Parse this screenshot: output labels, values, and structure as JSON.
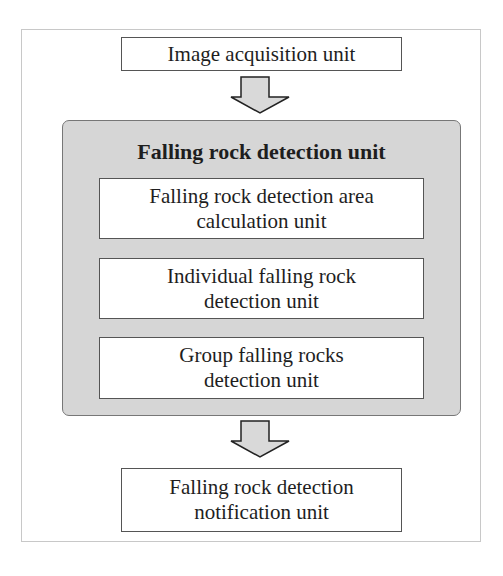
{
  "diagram": {
    "top_box": {
      "label": "Image acquisition unit"
    },
    "group": {
      "title": "Falling rock detection unit",
      "children": [
        {
          "line1": "Falling rock detection area",
          "line2": "calculation unit"
        },
        {
          "line1": "Individual falling rock",
          "line2": "detection unit"
        },
        {
          "line1": "Group falling rocks",
          "line2": "detection unit"
        }
      ]
    },
    "bottom_box": {
      "line1": "Falling rock detection",
      "line2": "notification unit"
    },
    "arrows": [
      {
        "from": "Image acquisition unit",
        "to": "Falling rock detection unit",
        "icon": "down-arrow-icon"
      },
      {
        "from": "Falling rock detection unit",
        "to": "Falling rock detection notification unit",
        "icon": "down-arrow-icon"
      }
    ],
    "colors": {
      "group_fill": "#d6d6d6",
      "arrow_fill": "#d9d9d9",
      "border": "#555555"
    }
  }
}
